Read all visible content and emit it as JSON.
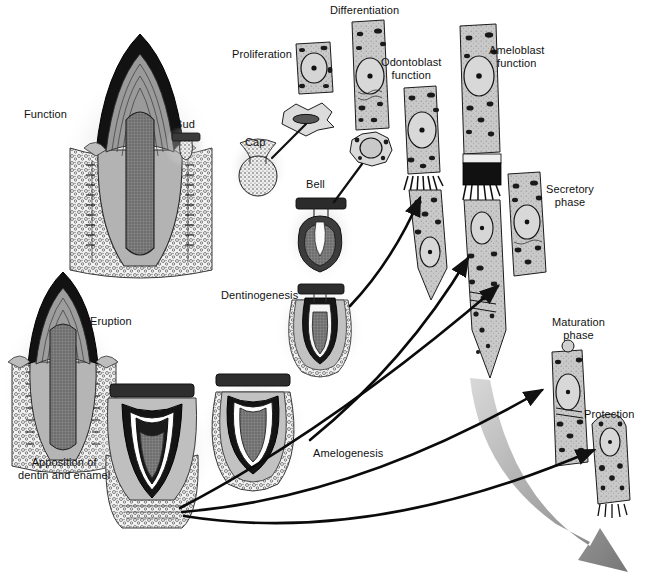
{
  "diagram": {
    "type": "biological-process-diagram",
    "background_color": "#ffffff",
    "ink_color": "#111111"
  },
  "labels": {
    "function": "Function",
    "bud": "Bud",
    "cap": "Cap",
    "bell": "Bell",
    "proliferation": "Proliferation",
    "differentiation": "Differentiation",
    "odontoblast_function": "Odontoblast\nfunction",
    "ameloblast_function": "Ameloblast\nfunction",
    "secretory_phase": "Secretory\nphase",
    "maturation_phase": "Maturation\nphase",
    "protection": "Protection",
    "dentinogenesis": "Dentinogenesis",
    "amelogenesis": "Amelogenesis",
    "eruption": "Eruption",
    "apposition": "Apposition of\ndentin and enamel"
  },
  "stages": [
    {
      "id": "bud",
      "label": "Bud",
      "kind": "tooth-germ"
    },
    {
      "id": "cap",
      "label": "Cap",
      "kind": "tooth-germ"
    },
    {
      "id": "bell",
      "label": "Bell",
      "kind": "tooth-germ"
    },
    {
      "id": "dentinogenesis",
      "label": "Dentinogenesis",
      "kind": "tooth-germ"
    },
    {
      "id": "apposition",
      "label": "Apposition of dentin and enamel",
      "kind": "tooth-germ"
    },
    {
      "id": "eruption",
      "label": "Eruption",
      "kind": "erupting-tooth"
    },
    {
      "id": "function",
      "label": "Function",
      "kind": "mature-tooth"
    }
  ],
  "cell_stages": [
    {
      "id": "proliferation",
      "label": "Proliferation",
      "kind": "cell"
    },
    {
      "id": "differentiation",
      "label": "Differentiation",
      "kind": "cell"
    },
    {
      "id": "odontoblast-function",
      "label": "Odontoblast function",
      "kind": "cell"
    },
    {
      "id": "ameloblast-function",
      "label": "Ameloblast function",
      "kind": "cell"
    },
    {
      "id": "secretory-phase",
      "label": "Secretory phase",
      "kind": "cell"
    },
    {
      "id": "maturation-phase",
      "label": "Maturation phase",
      "kind": "cell"
    },
    {
      "id": "protection",
      "label": "Protection",
      "kind": "cell"
    }
  ],
  "palette": {
    "enamel_dark": "#2b2b2b",
    "dentin_mid": "#7d7d7d",
    "pulp": "#6a6a6a",
    "bone_light": "#d9d9d9",
    "outline": "#1a1a1a",
    "arrow_gray": "#8e8e8e"
  }
}
